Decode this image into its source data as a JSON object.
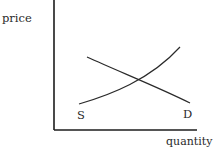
{
  "diagram": {
    "y_axis_label": "price",
    "x_axis_label": "quantity",
    "curves": [
      {
        "name": "supply",
        "label": "S"
      },
      {
        "name": "demand",
        "label": "D"
      }
    ],
    "colors": {
      "line": "#222222",
      "background": "#ffffff"
    }
  }
}
